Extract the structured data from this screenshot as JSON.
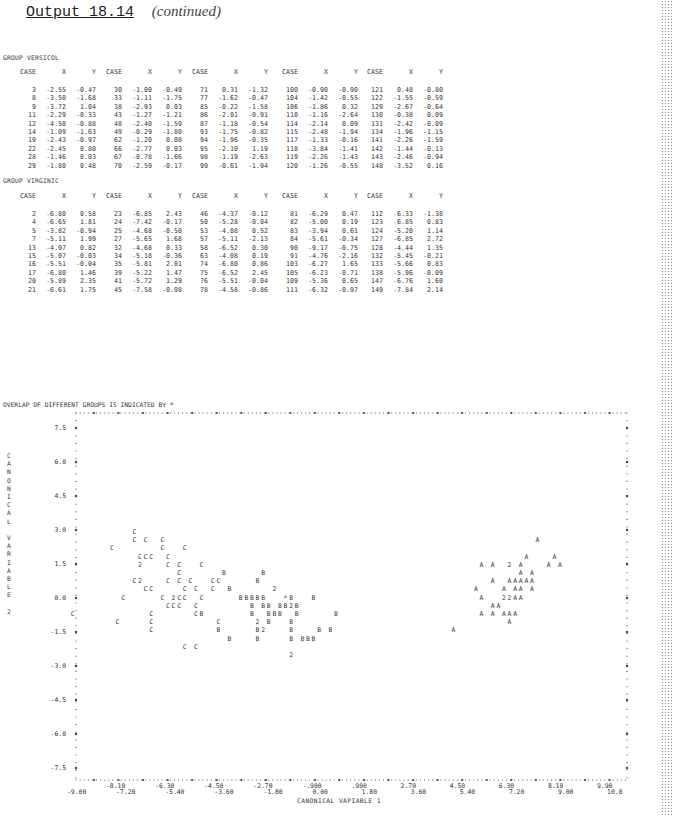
{
  "header": {
    "title": "Output 18.14",
    "subtitle": "(continued)"
  },
  "columns": [
    "CASE",
    "X",
    "Y"
  ],
  "groups": [
    {
      "label": "GROUP VERSICOL",
      "blocks": [
        [
          [
            "3",
            "-2.55",
            "-0.47"
          ],
          [
            "8",
            "-3.50",
            "-1.68"
          ],
          [
            "9",
            "-3.72",
            "1.04"
          ],
          [
            "11",
            "-2.29",
            "-0.33"
          ],
          [
            "12",
            "-4.50",
            "-0.88"
          ],
          [
            "14",
            "-1.09",
            "-1.63"
          ],
          [
            "19",
            "-2.43",
            "-0.97"
          ],
          [
            "22",
            "-2.45",
            "0.80"
          ],
          [
            "28",
            "-1.46",
            "0.03"
          ],
          [
            "29",
            "-1.80",
            "0.48"
          ]
        ],
        [
          [
            "30",
            "-1.00",
            "-0.49"
          ],
          [
            "33",
            "-1.11",
            "-1.75"
          ],
          [
            "38",
            "-2.93",
            "0.03"
          ],
          [
            "43",
            "-1.27",
            "-1.21"
          ],
          [
            "48",
            "-2.40",
            "-1.59"
          ],
          [
            "49",
            "-0.29",
            "-1.80"
          ],
          [
            "62",
            "-1.20",
            "0.08"
          ],
          [
            "66",
            "-2.77",
            "0.03"
          ],
          [
            "67",
            "-0.78",
            "-1.66"
          ],
          [
            "70",
            "-2.59",
            "-0.17"
          ]
        ],
        [
          [
            "71",
            "0.31",
            "-1.32"
          ],
          [
            "77",
            "-1.62",
            "-0.47"
          ],
          [
            "85",
            "-0.22",
            "-1.58"
          ],
          [
            "86",
            "-2.01",
            "-0.91"
          ],
          [
            "87",
            "-1.18",
            "-0.54"
          ],
          [
            "93",
            "-1.75",
            "-0.82"
          ],
          [
            "94",
            "-1.96",
            "-0.35"
          ],
          [
            "95",
            "-2.10",
            "1.19"
          ],
          [
            "98",
            "-1.19",
            "-2.63"
          ],
          [
            "99",
            "-0.61",
            "-1.94"
          ]
        ],
        [
          [
            "100",
            "-0.90",
            "-0.90"
          ],
          [
            "104",
            "-1.42",
            "-0.55"
          ],
          [
            "106",
            "-1.86",
            "0.32"
          ],
          [
            "110",
            "-1.16",
            "-2.64"
          ],
          [
            "114",
            "-2.14",
            "0.09"
          ],
          [
            "115",
            "-2.48",
            "-1.94"
          ],
          [
            "117",
            "-1.33",
            "-0.16"
          ],
          [
            "118",
            "-3.84",
            "-1.41"
          ],
          [
            "119",
            "-2.26",
            "-1.43"
          ],
          [
            "120",
            "-1.26",
            "-0.55"
          ]
        ],
        [
          [
            "121",
            "0.48",
            "-0.80"
          ],
          [
            "122",
            "-1.55",
            "-0.59"
          ],
          [
            "129",
            "-2.67",
            "-0.64"
          ],
          [
            "130",
            "-0.38",
            "0.09"
          ],
          [
            "131",
            "-2.42",
            "-0.09"
          ],
          [
            "134",
            "-1.96",
            "-1.15"
          ],
          [
            "141",
            "-2.26",
            "-1.59"
          ],
          [
            "142",
            "-1.44",
            "-0.13"
          ],
          [
            "143",
            "-2.46",
            "-0.94"
          ],
          [
            "148",
            "-3.52",
            "0.16"
          ]
        ]
      ]
    },
    {
      "label": "GROUP VIRGINIC",
      "blocks": [
        [
          [
            "2",
            "-6.80",
            "0.58"
          ],
          [
            "4",
            "-6.65",
            "1.81"
          ],
          [
            "5",
            "-3.82",
            "-0.94"
          ],
          [
            "7",
            "-5.11",
            "1.99"
          ],
          [
            "13",
            "-4.97",
            "0.82"
          ],
          [
            "15",
            "-5.07",
            "-0.03"
          ],
          [
            "16",
            "-5.51",
            "-0.04"
          ],
          [
            "17",
            "-6.80",
            "1.46"
          ],
          [
            "20",
            "-5.89",
            "2.35"
          ],
          [
            "21",
            "-6.61",
            "1.75"
          ]
        ],
        [
          [
            "23",
            "-6.85",
            "2.43"
          ],
          [
            "24",
            "-7.42",
            "-0.17"
          ],
          [
            "25",
            "-4.68",
            "-0.50"
          ],
          [
            "27",
            "-5.65",
            "1.68"
          ],
          [
            "32",
            "-4.68",
            "0.33"
          ],
          [
            "34",
            "-5.18",
            "-0.36"
          ],
          [
            "35",
            "-5.81",
            "2.01"
          ],
          [
            "39",
            "-5.22",
            "1.47"
          ],
          [
            "41",
            "-5.72",
            "1.29"
          ],
          [
            "45",
            "-7.58",
            "-0.98"
          ]
        ],
        [
          [
            "46",
            "-4.37",
            "-0.12"
          ],
          [
            "50",
            "-5.28",
            "-0.04"
          ],
          [
            "53",
            "-4.08",
            "0.52"
          ],
          [
            "57",
            "-5.11",
            "-2.13"
          ],
          [
            "58",
            "-6.52",
            "0.30"
          ],
          [
            "63",
            "-4.08",
            "0.19"
          ],
          [
            "74",
            "-6.80",
            "0.86"
          ],
          [
            "75",
            "-6.52",
            "2.45"
          ],
          [
            "76",
            "-5.51",
            "-0.04"
          ],
          [
            "78",
            "-4.58",
            "-0.86"
          ]
        ],
        [
          [
            "81",
            "-6.29",
            "0.47"
          ],
          [
            "82",
            "-5.00",
            "0.19"
          ],
          [
            "83",
            "-3.94",
            "0.61"
          ],
          [
            "84",
            "-5.61",
            "-0.34"
          ],
          [
            "90",
            "-9.17",
            "-0.75"
          ],
          [
            "91",
            "-4.76",
            "-2.16"
          ],
          [
            "103",
            "-6.27",
            "1.65"
          ],
          [
            "105",
            "-6.23",
            "-0.71"
          ],
          [
            "109",
            "-5.36",
            "0.65"
          ],
          [
            "111",
            "-6.32",
            "-0.97"
          ]
        ],
        [
          [
            "112",
            "-6.33",
            "-1.38"
          ],
          [
            "123",
            "-6.85",
            "0.83"
          ],
          [
            "124",
            "-5.20",
            "1.14"
          ],
          [
            "127",
            "-6.85",
            "2.72"
          ],
          [
            "128",
            "-4.44",
            "1.35"
          ],
          [
            "132",
            "-5.45",
            "-0.21"
          ],
          [
            "133",
            "-5.66",
            "0.83"
          ],
          [
            "138",
            "-5.96",
            "-0.09"
          ],
          [
            "147",
            "-6.76",
            "1.60"
          ],
          [
            "149",
            "-7.84",
            "2.14"
          ]
        ]
      ]
    }
  ],
  "plot": {
    "caption": "OVERLAP OF DIFFERENT GROUPS IS INDICATED BY *",
    "y_axis_label_letters": [
      "C",
      "A",
      "N",
      "O",
      "N",
      "I",
      "C",
      "A",
      "L",
      "",
      "V",
      "A",
      "R",
      "I",
      "A",
      "B",
      "L",
      "E",
      "",
      "2"
    ],
    "y_ticks": [
      "7.5",
      "6.0",
      "4.5",
      "3.0",
      "1.5",
      "0.0",
      "-1.5",
      "-3.0",
      "-4.5",
      "-6.0",
      "-7.5"
    ],
    "x_ticks_upper": [
      "-8.10",
      "-6.30",
      "-4.50",
      "-2.70",
      "-.900",
      ".900",
      "2.70",
      "4.50",
      "6.30",
      "8.10",
      "9.90"
    ],
    "x_ticks_lower": [
      "-9.00",
      "-7.20",
      "-5.40",
      "-3.60",
      "-1.80",
      "0.00",
      "1.80",
      "3.60",
      "5.40",
      "7.20",
      "9.00",
      "10.8"
    ],
    "x_axis_label": "CANONICAL VAPIABLE  1"
  },
  "chart_data": {
    "type": "scatter",
    "title": "OVERLAP OF DIFFERENT GROUPS IS INDICATED BY *",
    "xlabel": "CANONICAL VARIABLE 1",
    "ylabel": "CANONICAL VARIABLE 2",
    "xlim": [
      -9.0,
      10.8
    ],
    "ylim": [
      -7.5,
      7.5
    ],
    "grid": false,
    "legend": {
      "A": "SETOSA (plotted as A)",
      "B": "VERSICOL (plotted as B)",
      "C": "VIRGINIC (plotted as C)",
      "*": "overlap"
    },
    "series": [
      {
        "name": "VERSICOL (B)",
        "x": [
          -2.55,
          -3.5,
          -3.72,
          -2.29,
          -4.5,
          -1.09,
          -2.43,
          -2.45,
          -1.46,
          -1.8,
          -1.0,
          -1.11,
          -2.93,
          -1.27,
          -2.4,
          -0.29,
          -1.2,
          -2.77,
          -0.78,
          -2.59,
          0.31,
          -1.62,
          -0.22,
          -2.01,
          -1.18,
          -1.75,
          -1.96,
          -2.1,
          -1.19,
          -0.61,
          -0.9,
          -1.42,
          -1.86,
          -1.16,
          -2.14,
          -2.48,
          -1.33,
          -3.84,
          -2.26,
          -1.26,
          0.48,
          -1.55,
          -2.67,
          -0.38,
          -2.42,
          -1.96,
          -2.26,
          -1.44,
          -2.46,
          -3.52
        ],
        "y": [
          -0.47,
          -1.68,
          1.04,
          -0.33,
          -0.88,
          -1.63,
          -0.97,
          0.8,
          0.03,
          0.48,
          -0.49,
          -1.75,
          0.03,
          -1.21,
          -1.59,
          -1.8,
          0.08,
          0.03,
          -1.66,
          -0.17,
          -1.32,
          -0.47,
          -1.58,
          -0.91,
          -0.54,
          -0.82,
          -0.35,
          1.19,
          -2.63,
          -1.94,
          -0.9,
          -0.55,
          0.32,
          -2.64,
          0.09,
          -1.94,
          -0.16,
          -1.41,
          -1.43,
          -0.55,
          -0.8,
          -0.59,
          -0.64,
          0.09,
          -0.09,
          -1.15,
          -1.59,
          -0.13,
          -0.94,
          0.16
        ]
      },
      {
        "name": "VIRGINIC (C)",
        "x": [
          -6.8,
          -6.65,
          -3.82,
          -5.11,
          -4.97,
          -5.07,
          -5.51,
          -6.8,
          -5.89,
          -6.61,
          -6.85,
          -7.42,
          -4.68,
          -5.65,
          -4.68,
          -5.18,
          -5.81,
          -5.22,
          -5.72,
          -7.58,
          -4.37,
          -5.28,
          -4.08,
          -5.11,
          -6.52,
          -4.08,
          -6.8,
          -6.52,
          -5.51,
          -4.58,
          -6.29,
          -5.0,
          -3.94,
          -5.61,
          -9.17,
          -4.76,
          -6.27,
          -6.23,
          -5.36,
          -6.32,
          -6.33,
          -6.85,
          -5.2,
          -6.85,
          -4.44,
          -5.45,
          -5.66,
          -5.96,
          -6.76,
          -7.84
        ],
        "y": [
          0.58,
          1.81,
          -0.94,
          1.99,
          0.82,
          -0.03,
          -0.04,
          1.46,
          2.35,
          1.75,
          2.43,
          -0.17,
          -0.5,
          1.68,
          0.33,
          -0.36,
          2.01,
          1.47,
          1.29,
          -0.98,
          -0.12,
          -0.04,
          0.52,
          -2.13,
          0.3,
          0.19,
          0.86,
          2.45,
          -0.04,
          -0.86,
          0.47,
          0.19,
          0.61,
          -0.34,
          -0.75,
          -2.16,
          1.65,
          -0.71,
          0.65,
          -0.97,
          -1.38,
          0.83,
          1.14,
          2.72,
          1.35,
          -0.21,
          0.83,
          -0.09,
          1.6,
          2.14
        ]
      },
      {
        "name": "SETOSA (A)",
        "note": "values not tabulated on this page; approximate cluster read from plot",
        "x_range": [
          5.0,
          9.9
        ],
        "y_range": [
          -1.6,
          2.4
        ]
      }
    ]
  }
}
